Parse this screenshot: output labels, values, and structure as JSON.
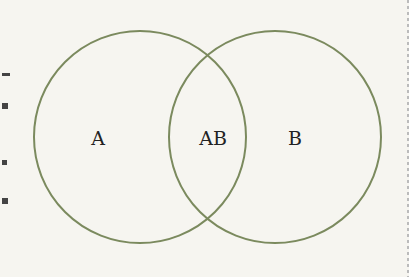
{
  "diagram": {
    "type": "venn",
    "stroke_color": "#7b8a5e",
    "background": "#f6f5f0",
    "circles": [
      {
        "id": "A",
        "cx": 140,
        "cy": 137,
        "r": 106
      },
      {
        "id": "B",
        "cx": 275,
        "cy": 137,
        "r": 106
      }
    ],
    "labels": {
      "a": "A",
      "ab": "AB",
      "b": "B"
    }
  }
}
